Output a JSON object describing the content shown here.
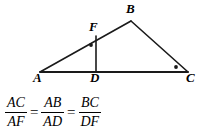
{
  "figure": {
    "stroke_color": "#1a1a1a",
    "background_color": "#ffffff",
    "points": {
      "A": {
        "label": "A",
        "x": 40,
        "y": 72
      },
      "B": {
        "label": "B",
        "x": 131,
        "y": 21
      },
      "C": {
        "label": "C",
        "x": 188,
        "y": 72
      },
      "D": {
        "label": "D",
        "x": 96,
        "y": 72
      },
      "F": {
        "label": "F",
        "x": 96,
        "y": 36
      }
    },
    "segments": [
      {
        "name": "AB",
        "from": "A",
        "to": "B"
      },
      {
        "name": "BC",
        "from": "B",
        "to": "C"
      },
      {
        "name": "AC",
        "from": "A",
        "to": "C"
      },
      {
        "name": "FD",
        "from": "F",
        "to": "D"
      }
    ],
    "right_angle_marks": [
      {
        "name": "right-angle-at-F",
        "vertex": "F",
        "x": 91,
        "y": 45
      },
      {
        "name": "right-angle-at-C",
        "vertex": "C",
        "x": 176,
        "y": 67
      }
    ]
  },
  "equation": {
    "terms": [
      {
        "numerator": "AC",
        "denominator": "AF"
      },
      {
        "numerator": "AB",
        "denominator": "AD"
      },
      {
        "numerator": "BC",
        "denominator": "DF"
      }
    ],
    "operators": [
      "=",
      "="
    ]
  }
}
